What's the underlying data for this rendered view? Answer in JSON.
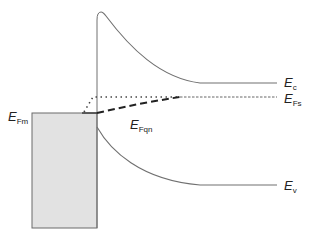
{
  "diagram": {
    "title": "",
    "type": "band-diagram",
    "colors": {
      "line": "#707070",
      "metal_fill": "#e2e2e2",
      "metal_border": "#6a6a6a",
      "fermi_dashed": "#222222",
      "fermi_dotted": "#444444",
      "text": "#222222"
    },
    "labels": {
      "ec": {
        "main": "E",
        "sub": "c"
      },
      "efs": {
        "main": "E",
        "sub": "Fs"
      },
      "efm": {
        "main": "E",
        "sub": "Fm"
      },
      "efqn": {
        "main": "E",
        "sub": "Fqn"
      },
      "ev": {
        "main": "E",
        "sub": "v"
      }
    },
    "regions": {
      "metal": "filled rectangle (metal contact)",
      "semiconductor": "band-bent region to the right of the interface"
    }
  }
}
